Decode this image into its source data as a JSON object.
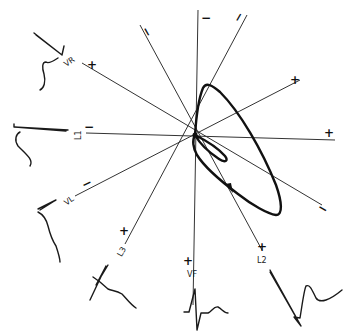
{
  "figure": {
    "type": "hexaxial lead reference diagram with vectorcardiographic loops",
    "center": [
      195,
      135
    ],
    "leads": [
      {
        "name": "L1",
        "label": "L1",
        "positive": "+",
        "negative": "−"
      },
      {
        "name": "L2",
        "label": "L2",
        "positive": "+",
        "negative": "−"
      },
      {
        "name": "L3",
        "label": "L3",
        "positive": "+",
        "negative": "−"
      },
      {
        "name": "VR",
        "label": "VR",
        "positive": "+",
        "negative": "−"
      },
      {
        "name": "VL",
        "label": "VL",
        "positive": "+",
        "negative": "−"
      },
      {
        "name": "VF",
        "label": "VF",
        "positive": "+",
        "negative": "−"
      }
    ],
    "signs": {
      "top_vertical": "−",
      "top_left": "−",
      "top_right": "−",
      "upper_left": "+",
      "upper_right": "+",
      "right": "+",
      "left": "−",
      "lower_left": "−",
      "lower_right": "−",
      "bottom_l3": "+",
      "bottom_vf": "+",
      "bottom_l2": "+"
    },
    "lead_labels": {
      "vr": "VR",
      "l1": "L1",
      "vl": "VL",
      "l3": "L3",
      "vf": "VF",
      "l2": "L2"
    },
    "loops": [
      {
        "name": "large-qrs-loop",
        "direction": "clockwise"
      },
      {
        "name": "small-t-loop"
      }
    ]
  }
}
